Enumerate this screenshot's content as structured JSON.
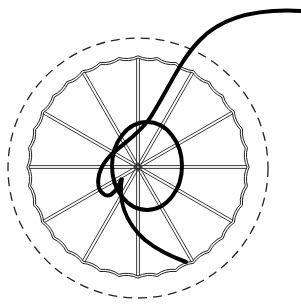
{
  "diagram": {
    "center": [
      138,
      167
    ],
    "outer_guide": {
      "radius": 130,
      "style": "dashed",
      "color": "#222222"
    },
    "fabric_edge": {
      "radius": 109,
      "style": "scalloped",
      "scallops": 36,
      "color": "#222222"
    },
    "spokes": {
      "count": 12,
      "style": "double-line",
      "color": "#222222"
    },
    "woven_ring": {
      "center": [
        147,
        166
      ],
      "rx": 35,
      "ry": 44,
      "stroke_width": 4,
      "color": "#000000"
    },
    "thread": {
      "stroke_width": 4,
      "color": "#000000",
      "start": [
        301,
        10
      ],
      "end": [
        186,
        262
      ]
    }
  }
}
